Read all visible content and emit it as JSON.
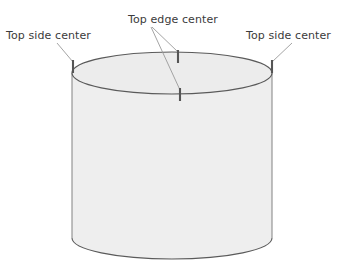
{
  "figure": {
    "background_color": "#ffffff",
    "shape": {
      "name": "cylinder",
      "fill_color": "#eeeeee",
      "stroke_color": "#5a5a5a",
      "hidden_edge_color": "#8c8c8c",
      "top_center": {
        "x": 172,
        "y": 73
      },
      "radius_x": 100,
      "radius_y": 21,
      "bottom_center": {
        "x": 172,
        "y": 238
      },
      "height": 165
    },
    "markers": {
      "color": "#555555",
      "items": [
        {
          "name": "top-side-center-left-marker",
          "x": 73,
          "y1": 60,
          "y2": 73
        },
        {
          "name": "top-edge-center-back-marker",
          "x": 178,
          "y1": 50,
          "y2": 63
        },
        {
          "name": "top-edge-center-front-marker",
          "x": 180,
          "y1": 88,
          "y2": 101
        },
        {
          "name": "top-side-center-right-marker",
          "x": 272,
          "y1": 60,
          "y2": 73
        }
      ]
    },
    "leaders": {
      "color": "#9a9a9a",
      "items": [
        {
          "name": "leader-top-side-left",
          "x1": 57,
          "y1": 43,
          "x2": 73,
          "y2": 62
        },
        {
          "name": "leader-top-edge-back",
          "x1": 152,
          "y1": 27,
          "x2": 178,
          "y2": 52
        },
        {
          "name": "leader-top-edge-front",
          "x1": 151,
          "y1": 27,
          "x2": 180,
          "y2": 90
        },
        {
          "name": "leader-top-side-right",
          "x1": 292,
          "y1": 43,
          "x2": 272,
          "y2": 62
        }
      ]
    },
    "labels": {
      "top_side_center_left": "Top side center",
      "top_edge_center": "Top edge center",
      "top_side_center_right": "Top side center"
    },
    "text_color": "#3b3b3b"
  }
}
